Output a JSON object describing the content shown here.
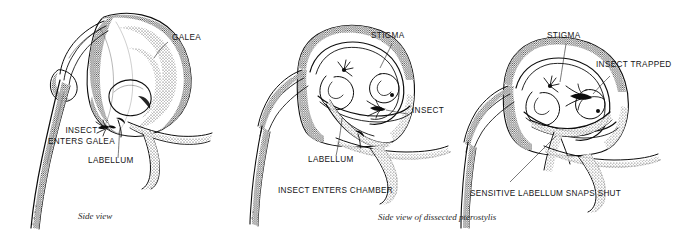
{
  "figure": {
    "background_color": "#ffffff",
    "ink_color": "#0d0d0d",
    "label_color": "#141414",
    "caption_color": "#2b2b2b"
  },
  "panels": [
    {
      "id": "panel-1",
      "stage_caption": "",
      "italic_caption": "Side view",
      "labels": [
        {
          "name": "galea",
          "text": "GALEA"
        },
        {
          "name": "insect-enters-galea-line1",
          "text": "INSECT"
        },
        {
          "name": "insect-enters-galea-line2",
          "text": "ENTERS GALEA"
        },
        {
          "name": "labellum",
          "text": "LABELLUM"
        }
      ]
    },
    {
      "id": "panel-2",
      "stage_caption": "INSECT ENTERS CHAMBER",
      "italic_caption": "",
      "labels": [
        {
          "name": "stigma",
          "text": "STIGMA"
        },
        {
          "name": "insect",
          "text": "INSECT"
        },
        {
          "name": "labellum",
          "text": "LABELLUM"
        }
      ]
    },
    {
      "id": "panel-3",
      "stage_caption": "SENSITIVE LABELLUM SNAPS SHUT",
      "italic_caption": "",
      "labels": [
        {
          "name": "stigma",
          "text": "STIGMA"
        },
        {
          "name": "insect-trapped",
          "text": "INSECT TRAPPED"
        }
      ]
    }
  ],
  "shared_caption": {
    "name": "side-view-dissected-caption",
    "text": "Side view of dissected pterostylis"
  }
}
